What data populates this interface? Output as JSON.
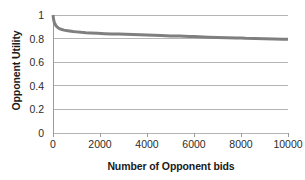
{
  "chart_data": {
    "type": "line",
    "title": "",
    "xlabel": "Number of Opponent bids",
    "ylabel": "Opponent Utility",
    "xlim": [
      0,
      10000
    ],
    "ylim": [
      0,
      1
    ],
    "xticks": [
      0,
      2000,
      4000,
      6000,
      8000,
      10000
    ],
    "xtick_labels": [
      "0",
      "2000",
      "4000",
      "6000",
      "8000",
      "10000"
    ],
    "yticks": [
      0,
      0.2,
      0.4,
      0.6,
      0.8,
      1
    ],
    "ytick_labels": [
      "0",
      "0.2",
      "0.4",
      "0.6",
      "0.8",
      "1"
    ],
    "grid": "horizontal",
    "legend": "none",
    "series": [
      {
        "name": "Opponent Utility",
        "color": "#7f7f7f",
        "line_width": 3,
        "x": [
          0,
          25,
          50,
          80,
          120,
          170,
          230,
          300,
          380,
          470,
          570,
          700,
          850,
          1000,
          1200,
          1400,
          1600,
          1900,
          2200,
          2500,
          2800,
          3100,
          3400,
          3700,
          4000,
          4300,
          4600,
          5000,
          5400,
          5800,
          6000,
          6200,
          6600,
          7000,
          7400,
          7800,
          8000,
          8200,
          8600,
          9000,
          9400,
          9800,
          10000
        ],
        "y": [
          1.0,
          0.963,
          0.941,
          0.925,
          0.911,
          0.899,
          0.89,
          0.883,
          0.877,
          0.872,
          0.868,
          0.864,
          0.86,
          0.857,
          0.853,
          0.85,
          0.848,
          0.845,
          0.842,
          0.84,
          0.838,
          0.836,
          0.834,
          0.832,
          0.83,
          0.828,
          0.826,
          0.823,
          0.821,
          0.818,
          0.817,
          0.815,
          0.812,
          0.81,
          0.808,
          0.806,
          0.805,
          0.803,
          0.801,
          0.799,
          0.797,
          0.795,
          0.794
        ]
      }
    ],
    "annotations": []
  },
  "colors": {
    "series_line": "#7f7f7f",
    "gridline": "#b5b5b5",
    "axis_line": "#9a9a9a",
    "tick_text": "#2b2b2b",
    "title_text": "#1a1a1a",
    "background": "#ffffff"
  },
  "axis": {
    "y_title": "Opponent Utility",
    "x_title": "Number of Opponent bids"
  }
}
